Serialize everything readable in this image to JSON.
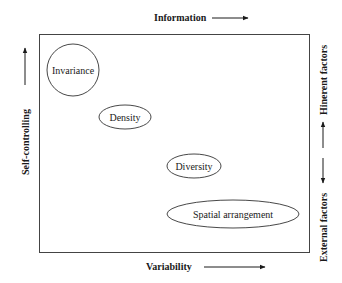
{
  "diagram": {
    "type": "conceptual-quadrant",
    "axes": {
      "top": {
        "label": "Information",
        "direction": "right"
      },
      "bottom": {
        "label": "Variability",
        "direction": "right"
      },
      "left": {
        "label": "Self-controlling",
        "direction": "up"
      },
      "right_upper": {
        "label": "Hinerent factors",
        "direction": "up"
      },
      "right_lower": {
        "label": "External factors",
        "direction": "down"
      }
    },
    "nodes": [
      {
        "id": "invariance",
        "label": "Invariance",
        "shape": "circle"
      },
      {
        "id": "density",
        "label": "Density",
        "shape": "ellipse"
      },
      {
        "id": "diversity",
        "label": "Diversity",
        "shape": "ellipse"
      },
      {
        "id": "spatial",
        "label": "Spatial arrangement",
        "shape": "ellipse"
      }
    ]
  }
}
